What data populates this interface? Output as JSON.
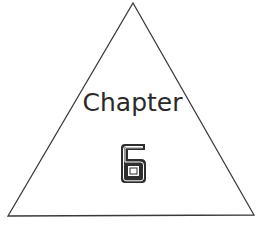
{
  "figure": {
    "shape": "triangle",
    "title": "Chapter",
    "number": "6",
    "stroke_color": "#333333",
    "text_color": "#2a2a2a",
    "background_color": "#ffffff"
  }
}
